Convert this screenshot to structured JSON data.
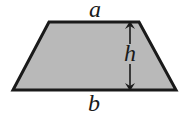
{
  "diagram": {
    "shape": "trapezoid",
    "fill_color": "#b9b9b9",
    "stroke_color": "#1a1a1a",
    "labels": {
      "top": "a",
      "bottom": "b",
      "height": "h"
    }
  }
}
